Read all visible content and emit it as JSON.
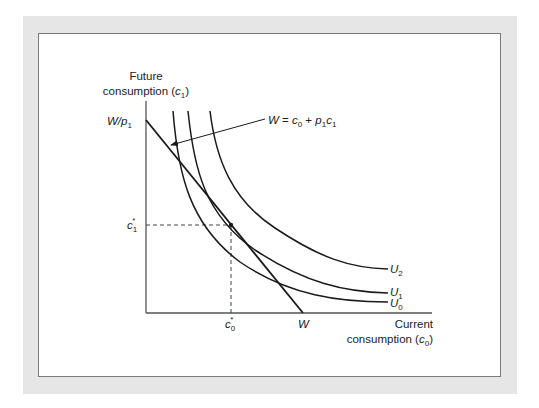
{
  "diagram": {
    "y_axis_label_line1": "Future",
    "y_axis_label_line2": "consumption (",
    "y_axis_var": "c",
    "y_axis_var_sub": "1",
    "x_axis_label_line1": "Current",
    "x_axis_label_line2": "consumption (",
    "x_axis_var": "c",
    "x_axis_var_sub": "0",
    "close_paren": ")",
    "y_intercept_label": "W/p",
    "y_intercept_sub": "1",
    "x_intercept_label": "W",
    "c1_star": "c",
    "c1_star_sub": "1",
    "c0_star": "c",
    "c0_star_sub": "0",
    "star": "*",
    "budget_equation": {
      "W": "W",
      "eq": " = ",
      "c": "c",
      "c_sub": "0",
      "plus": " + ",
      "p": "p",
      "p_sub": "1",
      "c2": "c",
      "c2_sub": "1"
    },
    "curves": [
      {
        "label": "U",
        "sub": "2"
      },
      {
        "label": "U",
        "sub": "1"
      },
      {
        "label": "U",
        "sub": "0"
      }
    ],
    "colors": {
      "frame": "#e6e6e6",
      "line": "#1a1a1a",
      "axis": "#555555",
      "dashed": "#444444"
    }
  }
}
